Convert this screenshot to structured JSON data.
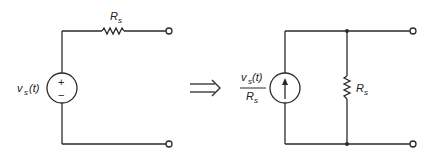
{
  "diagram": {
    "left_circuit": {
      "source_label_main": "v",
      "source_label_sub": "s",
      "source_label_arg": "(t)",
      "source_plus": "+",
      "source_minus": "−",
      "resistor_label_main": "R",
      "resistor_label_sub": "s",
      "source_type": "voltage-source",
      "resistor_connection": "series"
    },
    "transform_arrow": "⇒",
    "right_circuit": {
      "source_num_main": "v",
      "source_num_sub": "s",
      "source_num_arg": "(t)",
      "source_den_main": "R",
      "source_den_sub": "s",
      "resistor_label_main": "R",
      "resistor_label_sub": "s",
      "source_type": "current-source",
      "resistor_connection": "parallel"
    },
    "colors": {
      "line": "#2a2a2a",
      "background": "#ffffff"
    }
  }
}
